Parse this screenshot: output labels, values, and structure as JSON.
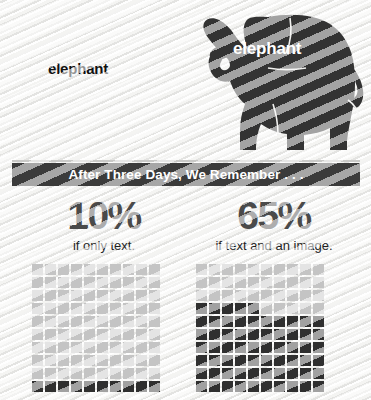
{
  "artwork": {
    "elephant_icon": "elephant-silhouette",
    "label_text_only": "elephant",
    "label_on_image": "elephant",
    "body_color": "#333333"
  },
  "banner": {
    "title": "After Three Days, We Remember . . .",
    "background_color": "#3b3b3b",
    "text_color": "#ffffff"
  },
  "stats": [
    {
      "value": "10%",
      "caption": "if only text."
    },
    {
      "value": "65%",
      "caption": "if text and an image."
    }
  ],
  "chart_data": {
    "type": "bar",
    "title": "After Three Days, We Remember . . .",
    "subtype": "waffle-grid-percentage",
    "categories": [
      "if only text.",
      "if text and an image."
    ],
    "values": [
      10,
      65
    ],
    "unit": "%",
    "ylim": [
      0,
      100
    ],
    "grid_columns": 10,
    "grid_rows": 10,
    "total_cells": 100,
    "filled_color": "#2f2f2f",
    "empty_color": "#c4c4c4",
    "xlabel": "",
    "ylabel": "",
    "grid": false,
    "legend": "none",
    "note": "Each waffle grid is 10x10 = 100 cells; filled cells count equals the percentage. Grids are filled from the bottom row upward and are cropped at the bottom of the frame.",
    "series": [
      {
        "name": "if only text.",
        "filled_cells": 10,
        "empty_cells": 90
      },
      {
        "name": "if text and an image.",
        "filled_cells": 65,
        "empty_cells": 35
      }
    ]
  }
}
